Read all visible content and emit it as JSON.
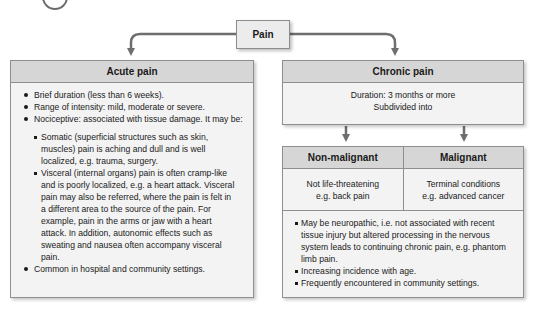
{
  "root": {
    "label": "Pain"
  },
  "acute": {
    "title": "Acute pain",
    "bullets": [
      "Brief duration (less than 6 weeks).",
      "Range of intensity: mild, moderate or severe.",
      "Nociceptive: associated with tissue damage. It may be:",
      "Common in hospital and community settings."
    ],
    "sub_bullets": [
      "Somatic (superficial structures such as skin, muscles) pain is aching and dull and is well localized, e.g. trauma, surgery.",
      "Visceral (internal organs) pain is often cramp-like and is poorly localized, e.g. a heart attack. Visceral pain may also be referred, where the pain is felt in a different area to the source of the pain. For example, pain in the arms or jaw with a heart attack. In addition, autonomic effects such as sweating and nausea often accompany visceral pain."
    ]
  },
  "chronic": {
    "title": "Chronic pain",
    "line1": "Duration: 3 months or more",
    "line2": "Subdivided into",
    "subtypes": [
      {
        "title": "Non-malignant",
        "line1": "Not life-threatening",
        "line2": "e.g. back pain"
      },
      {
        "title": "Malignant",
        "line1": "Terminal conditions",
        "line2": "e.g. advanced cancer"
      }
    ],
    "bullets": [
      "May be neuropathic, i.e. not associated with recent tissue injury but altered processing in the nervous system leads to continuing chronic pain, e.g. phantom limb pain.",
      "Increasing incidence with age.",
      "Frequently encountered in community settings."
    ]
  },
  "colors": {
    "header_fill": "#d6d6d6",
    "body_fill": "#f3f3f3",
    "border": "#8f8f8f",
    "arrow": "#6e6e6e"
  }
}
